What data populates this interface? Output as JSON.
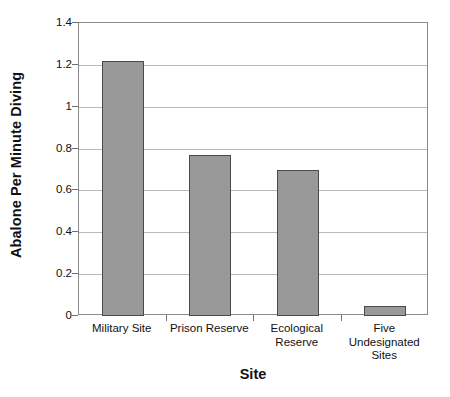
{
  "chart_data": {
    "type": "bar",
    "title": "",
    "xlabel": "Site",
    "ylabel": "Abalone Per Minute Diving",
    "categories": [
      "Military Site",
      "Prison Reserve",
      "Ecological Reserve",
      "Five Undesignated Sites"
    ],
    "category_label_lines": [
      [
        "Military Site"
      ],
      [
        "Prison Reserve"
      ],
      [
        "Ecological",
        "Reserve"
      ],
      [
        "Five",
        "Undesignated",
        "Sites"
      ]
    ],
    "values": [
      1.22,
      0.77,
      0.7,
      0.05
    ],
    "ylim": [
      0,
      1.4
    ],
    "ytick_values": [
      0,
      0.2,
      0.4,
      0.6,
      0.8,
      1,
      1.2,
      1.4
    ],
    "ytick_labels": [
      "0",
      "0.2",
      "0.4",
      "0.6",
      "0.8",
      "1",
      "1.2",
      "1.4"
    ],
    "grid": true,
    "grid_axis": "y",
    "legend": "none",
    "bar_color": "#999999",
    "bar_border_color": "#4a4a4a",
    "grid_color": "#b9b9b9",
    "axis_color": "#8a8a8a",
    "text_color": "#111111"
  }
}
